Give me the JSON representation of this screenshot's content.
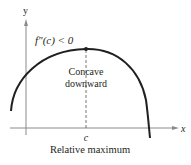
{
  "diagram": {
    "axes": {
      "x_label": "x",
      "y_label": "y"
    },
    "annotations": {
      "second_derivative": "f″(c) < 0",
      "concavity_line1": "Concave",
      "concavity_line2": "downward",
      "point_label": "c",
      "caption": "Relative maximum"
    },
    "colors": {
      "curve": "#231f20",
      "axes": "#8a8a8a",
      "dashed": "#555555",
      "text": "#231f20"
    }
  }
}
